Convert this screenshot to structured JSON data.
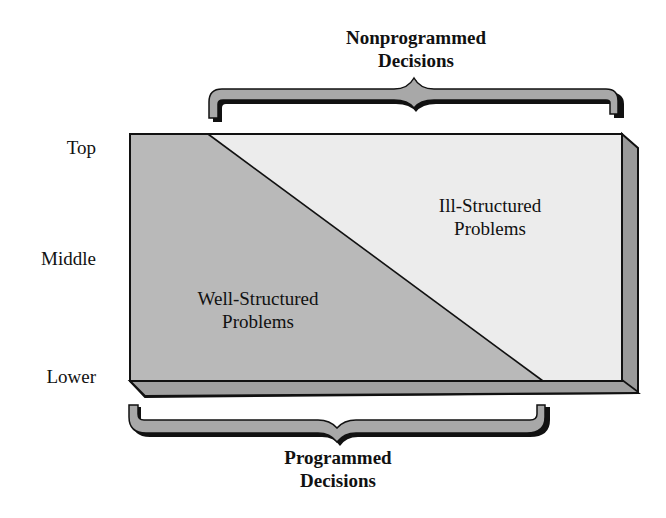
{
  "levels": [
    {
      "label": "Top"
    },
    {
      "label": "Middle"
    },
    {
      "label": "Lower"
    }
  ],
  "top_brace": {
    "line1": "Nonprogrammed",
    "line2": "Decisions"
  },
  "bottom_brace": {
    "line1": "Programmed",
    "line2": "Decisions"
  },
  "regions": {
    "well_structured": {
      "line1": "Well-Structured",
      "line2": "Problems"
    },
    "ill_structured": {
      "line1": "Ill-Structured",
      "line2": "Problems"
    }
  },
  "colors": {
    "well_structured_fill": "#b9b9b9",
    "ill_structured_fill": "#ececec",
    "side_face_fill": "#9a9a9a",
    "brace_fill": "#a8a8a8",
    "outline": "#111111"
  }
}
